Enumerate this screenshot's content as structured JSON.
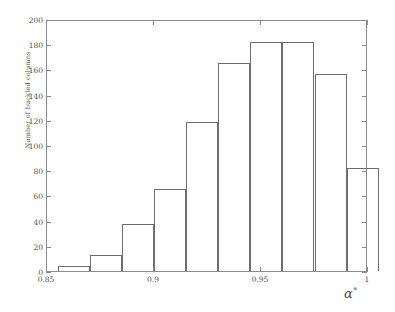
{
  "chart_data": {
    "type": "bar",
    "title": "",
    "subtitle": "",
    "xlabel": "α",
    "xlabel_superscript": "*",
    "ylabel": "Number of buckled columns",
    "xlim": [
      0.85,
      1.0
    ],
    "ylim": [
      0,
      200
    ],
    "grid": false,
    "legend": null,
    "xticks": [
      0.85,
      0.9,
      0.95,
      1.0
    ],
    "xtick_labels": [
      "0.85",
      "0.9",
      "0.95",
      "1"
    ],
    "yticks": [
      0,
      20,
      40,
      60,
      80,
      100,
      120,
      140,
      160,
      180,
      200
    ],
    "ytick_labels": [
      "0",
      "20",
      "40",
      "60",
      "80",
      "100",
      "120",
      "140",
      "160",
      "180",
      "200"
    ],
    "bin_edges": [
      0.855,
      0.87,
      0.885,
      0.9,
      0.915,
      0.93,
      0.945,
      0.96,
      0.975,
      0.99,
      1.005
    ],
    "categories": [
      "0.855-0.870",
      "0.870-0.885",
      "0.885-0.900",
      "0.900-0.915",
      "0.915-0.930",
      "0.930-0.945",
      "0.945-0.960",
      "0.960-0.975",
      "0.975-0.990",
      "0.990-1.005"
    ],
    "values": [
      4,
      13,
      37,
      65,
      118,
      165,
      182,
      182,
      156,
      82
    ],
    "bar_edge_color": "#6e6e6e",
    "bar_fill_color": "none",
    "axis_color": "#8c8c8c",
    "text_color": "#4f4f4f",
    "background_color": "#ffffff"
  }
}
